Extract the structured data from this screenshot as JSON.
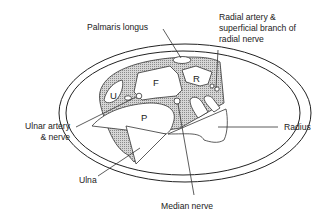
{
  "diagram": {
    "labels": {
      "palmaris_longus": "Palmaris longus",
      "radial_artery_line1": "Radial artery &",
      "radial_artery_line2": "superficial branch of",
      "radial_artery_line3": "radial nerve",
      "ulnar_artery_line1": "Ulnar artery",
      "ulnar_artery_line2": "& nerve",
      "radius": "Radius",
      "ulna": "Ulna",
      "median_nerve": "Median nerve"
    },
    "region_markers": {
      "F": "F",
      "R": "R",
      "U": "U",
      "P": "P"
    }
  }
}
